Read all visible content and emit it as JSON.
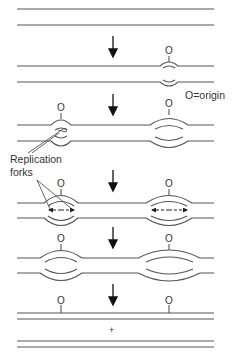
{
  "diagram": {
    "origin_label": "O",
    "legend": "O=origin",
    "forks_label_line1": "Replication",
    "forks_label_line2": "forks",
    "result_symbol": "+",
    "stages": [
      {
        "step": 1,
        "description": "Unreplicated double-stranded DNA"
      },
      {
        "step": 2,
        "description": "Replication begins at one origin"
      },
      {
        "step": 3,
        "description": "Second origin fires; two replication bubbles"
      },
      {
        "step": 4,
        "description": "Bidirectional fork movement"
      },
      {
        "step": 5,
        "description": "Bubbles enlarge"
      },
      {
        "step": 6,
        "description": "Two daughter duplexes"
      }
    ],
    "colors": {
      "line": "#555555",
      "arrow": "#111111",
      "text": "#333333"
    }
  }
}
